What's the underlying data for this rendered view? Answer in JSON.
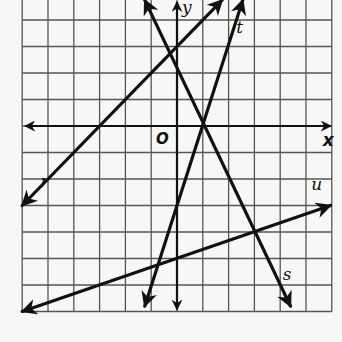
{
  "graph": {
    "origin_px": [
      177,
      126
    ],
    "unit_px": [
      25.8,
      26.5
    ],
    "x_range": [
      -6,
      6
    ],
    "y_range": [
      -7,
      4.75
    ],
    "axes": {
      "x_label": "x",
      "y_label": "y",
      "origin_label": "O"
    },
    "lines": [
      {
        "name": "r",
        "equation": "y = x + 3",
        "slope": 1,
        "intercept": 3,
        "from": [
          -6,
          -3
        ],
        "to": [
          1.75,
          4.75
        ],
        "label": "r",
        "label_pos": [
          -5.3,
          -2.3
        ]
      },
      {
        "name": "s",
        "equation": "y = -2x + 2",
        "slope": -2,
        "intercept": 2,
        "from": [
          -1.25,
          4.75
        ],
        "to": [
          4.4,
          -6.8
        ],
        "label": "s",
        "label_pos": [
          4.1,
          -5.8
        ]
      },
      {
        "name": "t",
        "equation": "y = 3x - 3",
        "slope": 3,
        "intercept": -3,
        "from": [
          -1.25,
          -6.8
        ],
        "to": [
          2.55,
          4.75
        ],
        "label": "t",
        "label_pos": [
          2.3,
          3.5
        ]
      },
      {
        "name": "u",
        "equation": "y = x/3 - 5",
        "slope": 0.3333,
        "intercept": -5,
        "from": [
          -6,
          -7
        ],
        "to": [
          5.95,
          -3.0
        ],
        "label": "u",
        "label_pos": [
          5.2,
          -2.4
        ]
      }
    ],
    "intersections": [
      {
        "lines": [
          "s",
          "t"
        ],
        "point": [
          1,
          0
        ]
      },
      {
        "lines": [
          "s",
          "u"
        ],
        "point": [
          3,
          -4
        ]
      }
    ]
  },
  "chart_data": {
    "type": "line",
    "title": "",
    "xlabel": "x",
    "ylabel": "y",
    "xlim": [
      -6,
      6
    ],
    "ylim": [
      -7,
      4.75
    ],
    "grid": true,
    "series": [
      {
        "name": "r",
        "x": [
          -6,
          1.75
        ],
        "y": [
          -3,
          4.75
        ]
      },
      {
        "name": "s",
        "x": [
          -1.25,
          4.4
        ],
        "y": [
          4.5,
          -6.8
        ]
      },
      {
        "name": "t",
        "x": [
          -1.25,
          2.55
        ],
        "y": [
          -6.75,
          4.65
        ]
      },
      {
        "name": "u",
        "x": [
          -6,
          5.95
        ],
        "y": [
          -7,
          -3.02
        ]
      }
    ]
  }
}
